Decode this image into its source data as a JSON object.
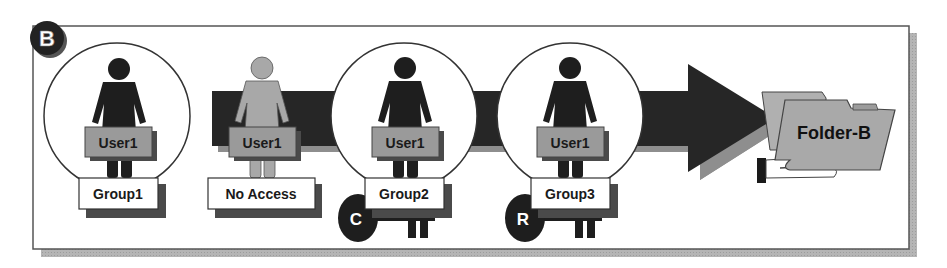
{
  "badge": {
    "letter": "B"
  },
  "flow_arrow": {
    "direction": "right",
    "color": "#2a2a2a",
    "shadow": "#8a8a8a"
  },
  "stages": [
    {
      "user_label": "User1",
      "group_label": "Group1",
      "circled": true,
      "user_state": "member",
      "key": null
    },
    {
      "user_label": "User1",
      "group_label": "No Access",
      "circled": false,
      "user_state": "denied",
      "key": null
    },
    {
      "user_label": "User1",
      "group_label": "Group2",
      "circled": true,
      "user_state": "member",
      "key": {
        "letter": "C"
      }
    },
    {
      "user_label": "User1",
      "group_label": "Group3",
      "circled": true,
      "user_state": "member",
      "key": {
        "letter": "R"
      }
    }
  ],
  "target": {
    "label": "Folder-B",
    "icon": "folder-in-hand-icon"
  },
  "colors": {
    "figure_dark": "#1e1e1e",
    "figure_light": "#a8a8a8",
    "user_label_bg": "#9a9a9a",
    "label_shadow": "#555555",
    "folder_fill": "#a9a9a9",
    "frame_shadow": "#b8b8b8"
  }
}
